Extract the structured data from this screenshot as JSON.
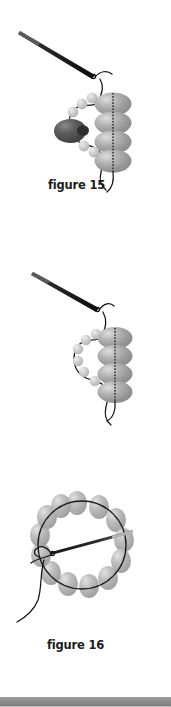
{
  "page": {
    "background_color": "#ffffff",
    "width": 171,
    "height": 707
  },
  "colors": {
    "thread": "#1a1a1a",
    "needle_dark": "#111111",
    "large_bead": "#a0a0a0",
    "large_bead_highlight": "#d6d6d6",
    "large_bead_shadow": "#7d7d7d",
    "small_bead": "#c3c3c3",
    "small_bead_highlight": "#e7e7e7",
    "drop_bead_dark": "#4a4a4a",
    "drop_bead_highlight": "#7a7a7a",
    "ring_bead": "#b4b4b4",
    "caption_text": "#1c1c1c",
    "bottom_bar": "#8e8e8e"
  },
  "figures": [
    {
      "id": "figure-15",
      "caption": "figure 15",
      "description": "Needle and thread passing through a column of four large beads with a curved row of small seed beads and a dark teardrop drop bead at the left",
      "elements": {
        "needle": "sewing-needle",
        "large_bead_count": 4,
        "small_bead_count": 7,
        "drop_bead_count": 1,
        "has_drop_bead": true
      }
    },
    {
      "id": "figure-16",
      "caption": "figure 16",
      "description": "Needle and thread passing through a column of four large beads with a curved row of six small seed beads at the left",
      "elements": {
        "needle": "sewing-needle",
        "large_bead_count": 4,
        "small_bead_count": 6,
        "drop_bead_count": 0,
        "has_drop_bead": false
      }
    },
    {
      "id": "figure-17",
      "caption": "figure 17",
      "description": "A closed ring of beads strung on thread forming a circle, with the needle entering from the left side toward the centre",
      "elements": {
        "needle": "sewing-needle",
        "ring_bead_count": 13,
        "shape": "circle"
      }
    }
  ],
  "bottom_bar": {
    "label": "page-edge-bar",
    "color": "#8e8e8e"
  }
}
